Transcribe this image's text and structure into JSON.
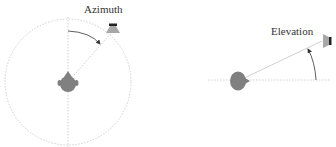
{
  "azimuth_panel": {
    "label": "Azimuth",
    "circle": {
      "cx": 68,
      "cy": 82,
      "r": 63
    },
    "listener_head": {
      "cx": 68,
      "cy": 82
    },
    "speaker": {
      "x": 113,
      "y": 31
    },
    "arc_arrow": "clockwise from front (top) toward speaker"
  },
  "elevation_panel": {
    "label": "Elevation",
    "horizontal_line": {
      "x1": 208,
      "x2": 330,
      "y": 80
    },
    "listener_head": {
      "cx": 239,
      "cy": 80
    },
    "speaker": {
      "x": 327,
      "y": 40
    },
    "arc_arrow": "upward from horizontal toward speaker"
  },
  "colors": {
    "line": "#b8b8b8",
    "head": "#808080",
    "speaker": "#a8a8a8",
    "arrow": "#333333",
    "text": "#333333"
  }
}
